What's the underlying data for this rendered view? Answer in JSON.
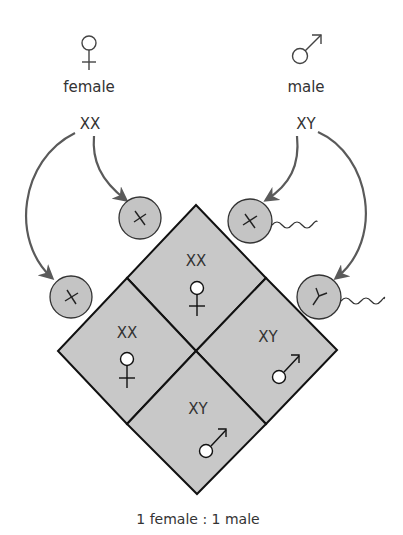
{
  "colors": {
    "background": "#ffffff",
    "cell_fill": "#c8c8c8",
    "gamete_fill": "#c4c4c4",
    "outline": "#111111",
    "arrow": "#5a5a5a",
    "text": "#333333",
    "symbol_dot_fill": "#ffffff"
  },
  "parents": {
    "female": {
      "symbol": "female-symbol",
      "label": "female",
      "genotype": "XX"
    },
    "male": {
      "symbol": "male-symbol",
      "label": "male",
      "genotype": "XY"
    }
  },
  "gametes": {
    "female": [
      {
        "chromosome": "X",
        "label": "X"
      },
      {
        "chromosome": "X",
        "label": "X"
      }
    ],
    "male": [
      {
        "chromosome": "X",
        "label": "X",
        "tail": true
      },
      {
        "chromosome": "Y",
        "label": "Y",
        "tail": true
      }
    ]
  },
  "punnett": {
    "cells": [
      {
        "position": "top",
        "genotype": "XX",
        "sex": "female"
      },
      {
        "position": "left",
        "genotype": "XX",
        "sex": "female"
      },
      {
        "position": "right",
        "genotype": "XY",
        "sex": "male"
      },
      {
        "position": "bottom",
        "genotype": "XY",
        "sex": "male"
      }
    ]
  },
  "footer": {
    "ratio": "1 female : 1 male"
  }
}
